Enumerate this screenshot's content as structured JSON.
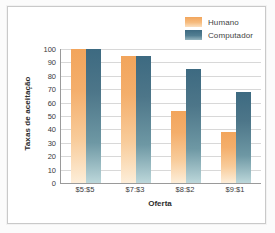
{
  "chart_data": {
    "type": "bar",
    "title": "",
    "xlabel": "Oferta",
    "ylabel": "Taxas de aceitação",
    "categories": [
      "$5:$5",
      "$7:$3",
      "$8:$2",
      "$9:$1"
    ],
    "series": [
      {
        "name": "Humano",
        "color": "#f2a55c",
        "values": [
          100,
          95,
          54,
          38
        ]
      },
      {
        "name": "Computador",
        "color": "#3d6a81",
        "values": [
          100,
          95,
          85,
          68
        ]
      }
    ],
    "ylim": [
      0,
      100
    ],
    "yticks": [
      0,
      10,
      20,
      30,
      40,
      50,
      60,
      70,
      80,
      90,
      100
    ],
    "ytick_labels": [
      "0",
      "10",
      "20",
      "30",
      "40",
      "50",
      "60",
      "70",
      "80",
      "90",
      "100"
    ],
    "grid": true,
    "legend_position": "top-right"
  },
  "legend": {
    "items": [
      {
        "label": "Humano"
      },
      {
        "label": "Computador"
      }
    ]
  }
}
